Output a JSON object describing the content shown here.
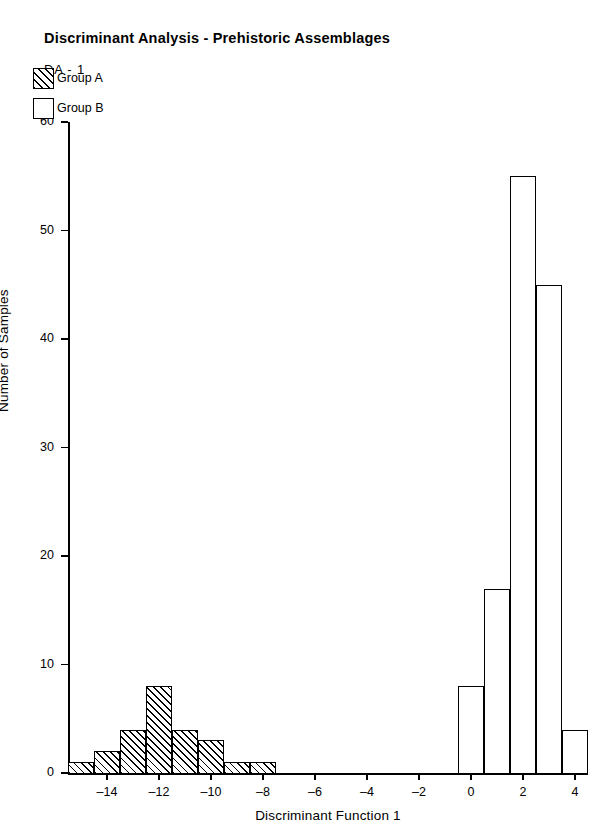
{
  "header": {
    "title": "Discriminant Analysis - Prehistoric Assemblages",
    "subtitle": "DA - 1"
  },
  "legend": {
    "items": [
      {
        "label": "Group A",
        "swatch": "hatched-square-icon"
      },
      {
        "label": "Group B",
        "swatch": "empty-square-icon"
      }
    ]
  },
  "chart_data": {
    "type": "bar",
    "title": "Discriminant Analysis - Prehistoric Assemblages",
    "subtitle": "DA - 1",
    "xlabel": "Discriminant Function 1",
    "ylabel": "Number of Samples",
    "xlim": [
      -15.5,
      4.5
    ],
    "ylim": [
      0,
      60
    ],
    "xticks": [
      -14,
      -12,
      -10,
      -8,
      -6,
      -4,
      -2,
      0,
      2,
      4
    ],
    "xticklabels": [
      "-14",
      "-12",
      "-10",
      "-8",
      "-6",
      "-4",
      "-2",
      "0",
      "2",
      "4"
    ],
    "yticks": [
      0,
      10,
      20,
      30,
      40,
      50,
      60
    ],
    "yticklabels": [
      "0",
      "10",
      "20",
      "30",
      "40",
      "50",
      "60"
    ],
    "grid": false,
    "legend_position": "upper-left-inside",
    "bin_width": 1,
    "series": [
      {
        "name": "Group A",
        "fill": "hatched",
        "x": [
          -15,
          -14,
          -13,
          -12,
          -11,
          -10,
          -9,
          -8
        ],
        "values": [
          1,
          2,
          4,
          8,
          4,
          3,
          1,
          1
        ]
      },
      {
        "name": "Group B",
        "fill": "empty",
        "x": [
          0,
          1,
          2,
          3,
          4
        ],
        "values": [
          8,
          17,
          55,
          45,
          4
        ]
      }
    ]
  }
}
